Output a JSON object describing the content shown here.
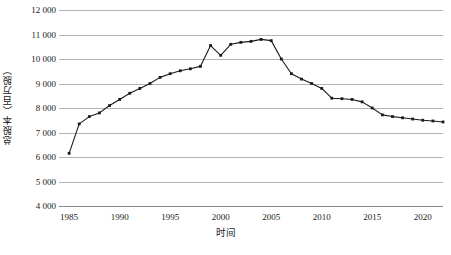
{
  "chart_data": {
    "type": "line",
    "title": "",
    "xlabel": "时间",
    "ylabel": "总股本（百万股）",
    "xlim": [
      1984,
      2022
    ],
    "ylim": [
      4000,
      12000
    ],
    "ytick_step": 1000,
    "grid": true,
    "legend": "none",
    "marker": "square",
    "line_color": "#1a1a1a",
    "grid_color": "#b3b3b3",
    "axis_color": "#8c8c8c",
    "background": "#ffffff",
    "y_tick_labels": [
      "4 000",
      "5 000",
      "6 000",
      "7 000",
      "8 000",
      "9 000",
      "10 000",
      "11 000",
      "12 000"
    ],
    "y_tick_values": [
      4000,
      5000,
      6000,
      7000,
      8000,
      9000,
      10000,
      11000,
      12000
    ],
    "x_tick_labels": [
      "1985",
      "1990",
      "1995",
      "2000",
      "2005",
      "2010",
      "2015",
      "2020"
    ],
    "x_tick_values": [
      1985,
      1990,
      1995,
      2000,
      2005,
      2010,
      2015,
      2020
    ],
    "x": [
      1985,
      1986,
      1987,
      1988,
      1989,
      1990,
      1991,
      1992,
      1993,
      1994,
      1995,
      1996,
      1997,
      1998,
      1999,
      2000,
      2001,
      2002,
      2003,
      2004,
      2005,
      2006,
      2007,
      2008,
      2009,
      2010,
      2011,
      2012,
      2013,
      2014,
      2015,
      2016,
      2017,
      2018,
      2019,
      2020,
      2021,
      2022
    ],
    "values": [
      6150,
      7350,
      7650,
      7800,
      8100,
      8350,
      8600,
      8800,
      9000,
      9250,
      9400,
      9520,
      9600,
      9700,
      10550,
      10150,
      10600,
      10680,
      10720,
      10800,
      10750,
      10000,
      9400,
      9180,
      9000,
      8800,
      8400,
      8380,
      8350,
      8250,
      8000,
      7720,
      7650,
      7600,
      7550,
      7500,
      7470,
      7430
    ],
    "series_name": "总股本"
  },
  "axis": {
    "y_title": "总股本（百万股）",
    "x_title": "时间"
  }
}
